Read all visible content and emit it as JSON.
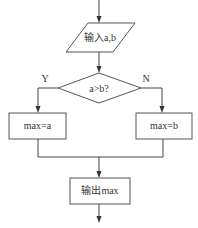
{
  "diagram": {
    "type": "flowchart",
    "nodes": {
      "input": {
        "shape": "parallelogram",
        "label": "输入a,b"
      },
      "decision": {
        "shape": "diamond",
        "label": "a>b?"
      },
      "assign_a": {
        "shape": "rectangle",
        "label": "max=a"
      },
      "assign_b": {
        "shape": "rectangle",
        "label": "max=b"
      },
      "output": {
        "shape": "rectangle",
        "label": "输出max"
      }
    },
    "branches": {
      "yes_label": "Y",
      "no_label": "N"
    },
    "colors": {
      "stroke": "#555555",
      "text": "#333333",
      "background": "#ffffff"
    }
  }
}
